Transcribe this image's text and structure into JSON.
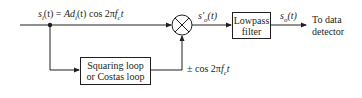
{
  "diagram": {
    "input_signal_label": "s_i(t) = Ad_i(t) cos 2πf_c t",
    "input_signal_parts": {
      "s": "s",
      "s_sub": "i",
      "t1": "(t) = ",
      "A": "Ad",
      "d_sub": "i",
      "rest": "(t) cos 2π",
      "f": "f",
      "f_sub": "c",
      "t2": "t"
    },
    "mixer_output_label": {
      "s": "s′",
      "sub": "o",
      "t": "(t)"
    },
    "filter_output_label": {
      "s": "s",
      "sub": "o",
      "t": "(t)"
    },
    "lowpass_filter": {
      "line1": "Lowpass",
      "line2": "filter"
    },
    "carrier_recovery": {
      "line1": "Squaring loop",
      "line2": "or Costas loop"
    },
    "carrier_label": {
      "pm": "± cos 2π",
      "f": "f",
      "f_sub": "c",
      "t": "t"
    },
    "destination": {
      "line1": "To data",
      "line2": "detector"
    },
    "colors": {
      "stroke": "#231f20"
    }
  }
}
